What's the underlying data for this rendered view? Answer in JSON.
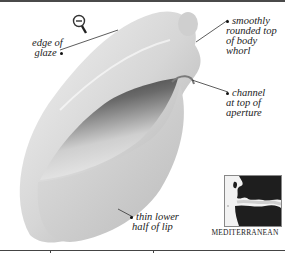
{
  "illustration": {
    "subject": "shell",
    "colors": {
      "shell_light": "#ececec",
      "shell_mid": "#bdbdbd",
      "shell_dark": "#3a3a3a"
    }
  },
  "labels": {
    "edge_of_glaze": [
      "edge of",
      "glaze"
    ],
    "smoothly_rounded": [
      "smoothly",
      "rounded top",
      "of body",
      "whorl"
    ],
    "channel": [
      "channel",
      "at top of",
      "aperture"
    ],
    "thin_lower": [
      "thin lower",
      "half of lip"
    ]
  },
  "map": {
    "caption": "MEDITERRANEAN"
  },
  "icons": {
    "scale_indicator": "magnifier-minus-icon"
  }
}
